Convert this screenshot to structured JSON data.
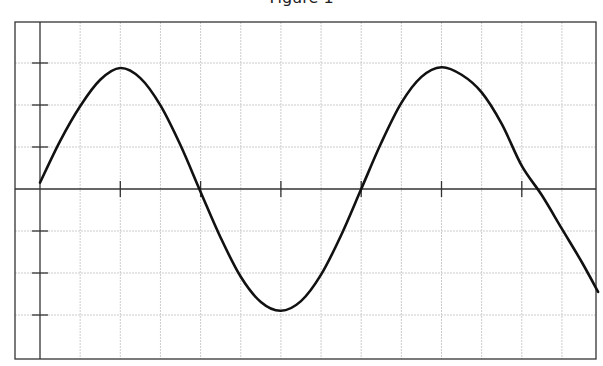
{
  "chart_data": {
    "type": "line",
    "title": "Figure 1",
    "xlabel": "",
    "ylabel": "",
    "xlim": [
      -0.3,
      6.95
    ],
    "ylim": [
      -3.2,
      3.0
    ],
    "grid": true,
    "x_ticks": [
      0,
      1,
      2,
      3,
      4,
      5,
      6
    ],
    "y_ticks": [
      -3,
      -2,
      -1,
      0,
      1,
      2,
      3
    ],
    "tick_labels_shown": false,
    "series": [
      {
        "name": "sine wave",
        "color": "#111111",
        "x": [
          0,
          0.25,
          0.5,
          0.75,
          1.0,
          1.25,
          1.5,
          1.75,
          2.0,
          2.25,
          2.5,
          2.75,
          3.0,
          3.25,
          3.5,
          3.75,
          4.0,
          4.25,
          4.5,
          4.75,
          5.0,
          5.25,
          5.5,
          5.75,
          6.0,
          6.25,
          6.5,
          6.75,
          6.95
        ],
        "y": [
          0.15,
          1.14,
          1.97,
          2.6,
          2.88,
          2.64,
          1.99,
          1.04,
          -0.07,
          -1.16,
          -2.09,
          -2.69,
          -2.9,
          -2.67,
          -2.04,
          -1.1,
          0.0,
          1.1,
          2.05,
          2.67,
          2.9,
          2.72,
          2.3,
          1.55,
          0.55,
          -0.15,
          -0.95,
          -1.75,
          -2.45
        ]
      }
    ]
  },
  "colors": {
    "frame": "#333333",
    "axis": "#333333",
    "grid": "#cccccc",
    "line": "#111111"
  }
}
